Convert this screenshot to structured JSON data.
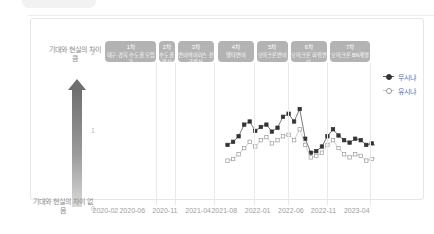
{
  "axis": {
    "y_top_caption": "기대와 현실의 차이 큼",
    "y_bottom_caption": "기대와 현실의 차이 없음",
    "y_ticks": [
      "0",
      "1",
      "2"
    ],
    "x_ticks": [
      "2020-02",
      "2020-06",
      "2020-11",
      "2021-04",
      "2021-08",
      "2022-01",
      "2022-06",
      "2022-11",
      "2023-04"
    ]
  },
  "legend": {
    "items": [
      {
        "label": "무시냐",
        "color": "#333333",
        "marker": "filled-square"
      },
      {
        "label": "유시냐",
        "color": "#b0b0b0",
        "marker": "open-square"
      }
    ],
    "position": "right"
  },
  "banners": [
    {
      "num": "1차",
      "text": "대구·경북 수도권 모임기"
    },
    {
      "num": "2차",
      "text": "수도권확산"
    },
    {
      "num": "3차",
      "text": "변이바이러스 전국확산"
    },
    {
      "num": "4차",
      "text": "델타변이"
    },
    {
      "num": "5차",
      "text": "오미크론변이"
    },
    {
      "num": "6차",
      "text": "오미크론 하위변이"
    },
    {
      "num": "7차",
      "text": "오미크론 BN계열"
    }
  ],
  "colors": {
    "banner_bg": "#b3b3b3",
    "series_a": "#333333",
    "series_b": "#b0b0b0",
    "grid": "#e9e9e9",
    "legend_text": "#5a6fb5"
  },
  "chart_data": {
    "type": "line",
    "xlabel": "",
    "ylabel": "기대와 현실의 차이",
    "ylim": [
      0,
      2
    ],
    "grid": false,
    "x": [
      "2020-02",
      "2020-06",
      "2020-11",
      "2021-04",
      "2021-08",
      "2022-01",
      "2022-06",
      "2022-11",
      "2023-04"
    ],
    "series": [
      {
        "name": "무시냐",
        "color": "#333333",
        "points": [
          [
            2021.62,
            0.82
          ],
          [
            2021.69,
            0.86
          ],
          [
            2021.76,
            0.93
          ],
          [
            2021.83,
            1.08
          ],
          [
            2021.9,
            1.12
          ],
          [
            2021.97,
            1.0
          ],
          [
            2022.04,
            1.05
          ],
          [
            2022.11,
            1.08
          ],
          [
            2022.18,
            0.99
          ],
          [
            2022.25,
            1.04
          ],
          [
            2022.32,
            1.18
          ],
          [
            2022.39,
            1.22
          ],
          [
            2022.46,
            1.12
          ],
          [
            2022.53,
            1.28
          ],
          [
            2022.6,
            0.9
          ],
          [
            2022.67,
            0.72
          ],
          [
            2022.74,
            0.74
          ],
          [
            2022.81,
            0.8
          ],
          [
            2022.88,
            0.93
          ],
          [
            2022.95,
            1.02
          ],
          [
            2023.02,
            0.94
          ],
          [
            2023.09,
            0.88
          ],
          [
            2023.16,
            0.85
          ],
          [
            2023.23,
            0.9
          ],
          [
            2023.3,
            0.88
          ],
          [
            2023.37,
            0.82
          ],
          [
            2023.44,
            0.84
          ],
          [
            2023.51,
            0.8
          ],
          [
            2023.58,
            0.78
          ],
          [
            2023.65,
            0.76
          ],
          [
            2023.72,
            0.74
          ]
        ]
      },
      {
        "name": "유시냐",
        "color": "#b0b0b0",
        "points": [
          [
            2021.62,
            0.62
          ],
          [
            2021.69,
            0.64
          ],
          [
            2021.76,
            0.7
          ],
          [
            2021.83,
            0.78
          ],
          [
            2021.9,
            0.86
          ],
          [
            2021.97,
            0.8
          ],
          [
            2022.04,
            0.88
          ],
          [
            2022.11,
            0.92
          ],
          [
            2022.18,
            0.84
          ],
          [
            2022.25,
            0.88
          ],
          [
            2022.32,
            0.93
          ],
          [
            2022.39,
            0.95
          ],
          [
            2022.46,
            0.88
          ],
          [
            2022.53,
            1.02
          ],
          [
            2022.6,
            0.82
          ],
          [
            2022.67,
            0.66
          ],
          [
            2022.74,
            0.68
          ],
          [
            2022.81,
            0.72
          ],
          [
            2022.88,
            0.82
          ],
          [
            2022.95,
            0.88
          ],
          [
            2023.02,
            0.78
          ],
          [
            2023.09,
            0.7
          ],
          [
            2023.16,
            0.66
          ],
          [
            2023.23,
            0.7
          ],
          [
            2023.3,
            0.68
          ],
          [
            2023.37,
            0.62
          ],
          [
            2023.44,
            0.64
          ],
          [
            2023.51,
            0.66
          ],
          [
            2023.58,
            0.7
          ],
          [
            2023.65,
            0.68
          ],
          [
            2023.72,
            0.66
          ]
        ]
      }
    ]
  }
}
